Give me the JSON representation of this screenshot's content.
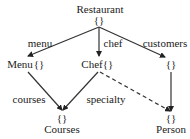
{
  "nodes": {
    "restaurant": {
      "name": "Restaurant",
      "braces": "{}"
    },
    "menu": {
      "name": "Menu",
      "braces": "{}"
    },
    "chef": {
      "name": "Chef",
      "braces": "{}"
    },
    "customers_obj": {
      "braces": "{}"
    },
    "courses": {
      "name": "Courses",
      "braces": "{}"
    },
    "person": {
      "name": "Person",
      "braces": "{}"
    }
  },
  "edges": {
    "menu": "menu",
    "chef": "chef",
    "customers": "customers",
    "courses": "courses",
    "specialty": "specialty"
  },
  "colors": {
    "line": "#333333",
    "text": "#222222"
  }
}
